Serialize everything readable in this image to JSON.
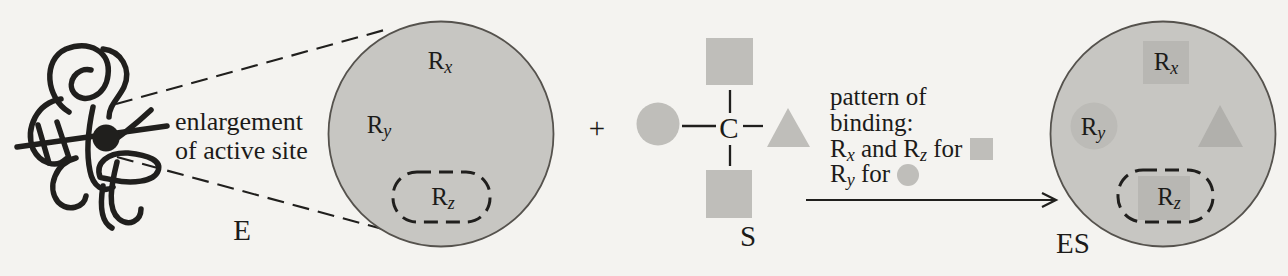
{
  "colors": {
    "background": "#f4f3f0",
    "ink": "#201f1d",
    "text-ink": "#1c1b19",
    "site-fill": "#c7c6c2",
    "site-edge": "#55524d",
    "shape-fill": "#bfbeba",
    "overlay-square": "#b8b7b3",
    "overlay-circle": "#bcbbb7",
    "overlay-triangle": "#b1b0ac"
  },
  "enzyme": {
    "label": "E",
    "annotation": {
      "line1": "enlargement",
      "line2": "of active site"
    }
  },
  "residues": {
    "rx": {
      "base": "R",
      "sub": "x"
    },
    "ry": {
      "base": "R",
      "sub": "y"
    },
    "rz": {
      "base": "R",
      "sub": "z"
    }
  },
  "operators": {
    "plus": "+"
  },
  "substrate": {
    "label": "S",
    "center_atom": "C",
    "groups": [
      "square-top",
      "circle-left",
      "triangle-right",
      "square-bottom"
    ]
  },
  "binding_pattern": {
    "line1": "pattern of",
    "line2": "binding:",
    "and": " and ",
    "for": " for "
  },
  "complex": {
    "label": "ES"
  }
}
